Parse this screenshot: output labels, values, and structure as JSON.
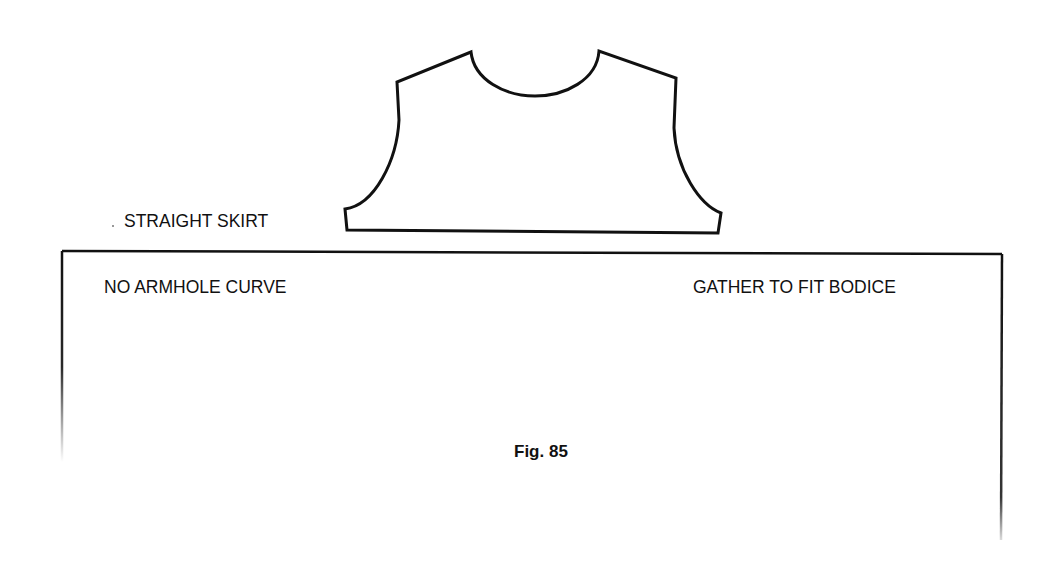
{
  "figure": {
    "caption": "Fig. 85",
    "labels": {
      "skirt_type": "STRAIGHT SKIRT",
      "left_note": "NO ARMHOLE CURVE",
      "right_note": "GATHER TO FIT BODICE"
    },
    "shapes": {
      "bodice": {
        "name": "bodice-pattern-piece",
        "stroke": "#111111",
        "path": "M 347 230 L 345 209 C 375 205 397 160 399 120 L 397 82 L 471 52 C 474 80 505 96 535 96 C 565 96 597 80 599 51 L 676 78 L 674 128 C 676 170 700 205 721 213 L 718 233 Z"
      },
      "skirt": {
        "name": "skirt-pattern-piece",
        "stroke": "#111111",
        "top_edge": "M 62 251 L 1002 254",
        "left_edge": "M 62 251 L 62 462",
        "right_edge": "M 1002 254 L 1001 540"
      }
    },
    "colors": {
      "ink": "#111111",
      "paper": "#ffffff"
    }
  }
}
